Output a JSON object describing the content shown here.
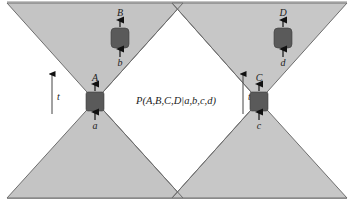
{
  "diagram": {
    "formula": "P(A,B,C,D|a,b,c,d)",
    "time_label": "t",
    "colors": {
      "cone_fill": "#c4c4c4",
      "cone_stroke": "#6e6e6e",
      "box_fill": "#5a5a5a",
      "arrow": "#111111",
      "background": "#ffffff"
    },
    "left_cone": {
      "lower_box": {
        "input": "a",
        "output": "A"
      },
      "upper_box": {
        "input": "b",
        "output": "B"
      },
      "time_axis": "t"
    },
    "right_cone": {
      "lower_box": {
        "input": "c",
        "output": "C"
      },
      "upper_box": {
        "input": "d",
        "output": "D"
      },
      "time_axis": "t"
    }
  }
}
